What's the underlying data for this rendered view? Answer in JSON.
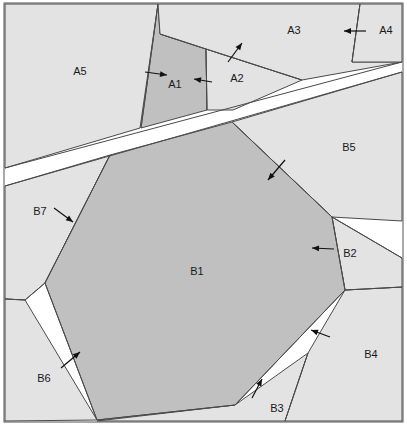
{
  "figure": {
    "width": 407,
    "height": 425,
    "background_color": "#ffffff",
    "frame": {
      "x": 4,
      "y": 3,
      "width": 399,
      "height": 419,
      "stroke": "#555555"
    },
    "colors": {
      "light_fill": "#e3e3e3",
      "dark_fill": "#c0c0c0",
      "gap_fill": "#ffffff",
      "edge_stroke": "#4a4a4a",
      "arrow_color": "#111111",
      "label_color": "#1a1a1a"
    }
  },
  "regions": [
    {
      "id": "A5",
      "label": "A5",
      "fill": "light",
      "label_x": 80,
      "label_y": 72,
      "points": "5,4 158,4 140,128 5,168"
    },
    {
      "id": "A1",
      "label": "A1",
      "fill": "dark",
      "label_x": 175,
      "label_y": 85,
      "points": "158,4 160,34 206,49 207,110 141,128"
    },
    {
      "id": "A2",
      "label": "A2",
      "fill": "light",
      "label_x": 237,
      "label_y": 79,
      "points": "206,49 302,80 233,110 207,110"
    },
    {
      "id": "A3",
      "label": "A3",
      "fill": "light",
      "label_x": 294,
      "label_y": 31,
      "points": "158,4 360,4 352,62 402,62 302,80 206,49 160,34"
    },
    {
      "id": "A4",
      "label": "A4",
      "fill": "light",
      "label_x": 386,
      "label_y": 31,
      "points": "360,4 402,4 402,62 352,62"
    },
    {
      "id": "B5",
      "label": "B5",
      "fill": "light",
      "label_x": 349,
      "label_y": 148,
      "points": "232,122 402,72 402,221 332,217"
    },
    {
      "id": "B7",
      "label": "B7",
      "fill": "light",
      "label_x": 40,
      "label_y": 212,
      "points": "5,186 110,155 45,283 25,300 5,299"
    },
    {
      "id": "B6",
      "label": "B6",
      "fill": "light",
      "label_x": 44,
      "label_y": 379,
      "points": "5,299 25,300 97,420 5,421"
    },
    {
      "id": "B3",
      "label": "B3",
      "fill": "light",
      "label_x": 277,
      "label_y": 409,
      "points": "235,405 308,353 285,421 97,421"
    },
    {
      "id": "B4",
      "label": "B4",
      "fill": "light",
      "label_x": 371,
      "label_y": 355,
      "points": "345,290 402,287 402,421 285,421 308,353"
    },
    {
      "id": "B2",
      "label": "B2",
      "fill": "light",
      "label_x": 350,
      "label_y": 254,
      "points": "332,217 402,258 402,287 345,290"
    },
    {
      "id": "B1",
      "label": "B1",
      "fill": "dark",
      "label_x": 197,
      "label_y": 272,
      "points": "232,122 332,217 345,290 235,405 97,420 45,283 110,155"
    }
  ],
  "divider_lines": [
    {
      "name": "a5-a1-edge",
      "x1": 158,
      "y1": 4,
      "x2": 141,
      "y2": 128
    },
    {
      "name": "a1-a2-edge",
      "x1": 206,
      "y1": 49,
      "x2": 207,
      "y2": 110
    },
    {
      "name": "a1-a3-edge",
      "x1": 160,
      "y1": 34,
      "x2": 206,
      "y2": 49
    },
    {
      "name": "a2-a3-edge",
      "x1": 206,
      "y1": 49,
      "x2": 302,
      "y2": 80
    },
    {
      "name": "a3-a4-edge",
      "x1": 360,
      "y1": 4,
      "x2": 352,
      "y2": 62
    },
    {
      "name": "band-upper-edge",
      "x1": 5,
      "y1": 168,
      "x2": 402,
      "y2": 62
    },
    {
      "name": "band-lower-edge",
      "x1": 5,
      "y1": 186,
      "x2": 402,
      "y2": 72
    },
    {
      "name": "b5-b1-edge",
      "x1": 232,
      "y1": 122,
      "x2": 332,
      "y2": 217
    },
    {
      "name": "b2-b5-edge",
      "x1": 332,
      "y1": 217,
      "x2": 402,
      "y2": 258
    },
    {
      "name": "b2-b4-edge",
      "x1": 345,
      "y1": 290,
      "x2": 402,
      "y2": 287
    },
    {
      "name": "b1-b2-edge",
      "x1": 332,
      "y1": 217,
      "x2": 345,
      "y2": 290
    },
    {
      "name": "b1-b4-edge",
      "x1": 345,
      "y1": 290,
      "x2": 235,
      "y2": 405
    },
    {
      "name": "b3-b4-edge",
      "x1": 308,
      "y1": 353,
      "x2": 285,
      "y2": 421
    },
    {
      "name": "b1-b3-edge",
      "x1": 235,
      "y1": 405,
      "x2": 97,
      "y2": 420
    },
    {
      "name": "b1-b6-edge",
      "x1": 97,
      "y1": 420,
      "x2": 45,
      "y2": 283
    },
    {
      "name": "b1-b7-edge",
      "x1": 45,
      "y1": 283,
      "x2": 110,
      "y2": 155
    },
    {
      "name": "b6-b7-edge",
      "x1": 25,
      "y1": 300,
      "x2": 5,
      "y2": 299
    },
    {
      "name": "b7-b6-inner-edge",
      "x1": 45,
      "y1": 283,
      "x2": 25,
      "y2": 300
    }
  ],
  "arrows": [
    {
      "name": "arrow-a1-left",
      "x1": 145,
      "y1": 72,
      "x2": 167,
      "y2": 75
    },
    {
      "name": "arrow-a1-right",
      "x1": 212,
      "y1": 82,
      "x2": 194,
      "y2": 79
    },
    {
      "name": "arrow-a2-up",
      "x1": 228,
      "y1": 62,
      "x2": 242,
      "y2": 43
    },
    {
      "name": "arrow-a4-left",
      "x1": 366,
      "y1": 31,
      "x2": 344,
      "y2": 31
    },
    {
      "name": "arrow-b5-into-b1",
      "x1": 285,
      "y1": 160,
      "x2": 268,
      "y2": 180
    },
    {
      "name": "arrow-b2-left",
      "x1": 334,
      "y1": 249,
      "x2": 312,
      "y2": 248
    },
    {
      "name": "arrow-b4-into-b1",
      "x1": 330,
      "y1": 337,
      "x2": 311,
      "y2": 330
    },
    {
      "name": "arrow-b3-up",
      "x1": 252,
      "y1": 398,
      "x2": 262,
      "y2": 379
    },
    {
      "name": "arrow-b6-up",
      "x1": 61,
      "y1": 368,
      "x2": 80,
      "y2": 352
    },
    {
      "name": "arrow-b7-down",
      "x1": 54,
      "y1": 208,
      "x2": 73,
      "y2": 222
    }
  ]
}
